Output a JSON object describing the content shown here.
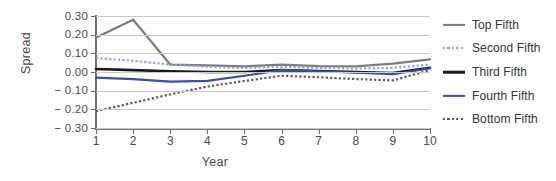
{
  "chart_data": {
    "type": "line",
    "title": "",
    "xlabel": "Year",
    "ylabel": "Spread",
    "x": [
      1,
      2,
      3,
      4,
      5,
      6,
      7,
      8,
      9,
      10
    ],
    "xtick_labels": [
      "1",
      "2",
      "3",
      "4",
      "5",
      "6",
      "7",
      "8",
      "9",
      "10"
    ],
    "ytick_labels": [
      "0.30",
      "0.20",
      "0.10",
      "0.00",
      "− 0.10",
      "− 0.20",
      "− 0.30"
    ],
    "ytick_values": [
      0.3,
      0.2,
      0.1,
      0.0,
      -0.1,
      -0.2,
      -0.3
    ],
    "ylim": [
      -0.3,
      0.3
    ],
    "xlim": [
      1,
      10
    ],
    "grid": "horizontal",
    "legend_position": "right",
    "series": [
      {
        "name": "Top Fifth",
        "style": "solid",
        "color": "#7c7c7c",
        "width": 2.2,
        "values": [
          0.185,
          0.28,
          0.04,
          0.035,
          0.03,
          0.04,
          0.032,
          0.03,
          0.045,
          0.068
        ]
      },
      {
        "name": "Second Fifth",
        "style": "dotted",
        "color": "#8fa7d4",
        "width": 2.2,
        "values": [
          0.075,
          0.06,
          0.04,
          0.028,
          0.022,
          0.028,
          0.022,
          0.018,
          0.022,
          0.04
        ]
      },
      {
        "name": "Third Fifth",
        "style": "solid",
        "color": "#1a1a1a",
        "width": 2.6,
        "values": [
          0.016,
          0.01,
          0.004,
          0.0,
          0.0,
          0.01,
          0.005,
          0.0,
          -0.005,
          0.022
        ]
      },
      {
        "name": "Fourth Fifth",
        "style": "solid",
        "color": "#3a4fa0",
        "width": 2.2,
        "values": [
          -0.03,
          -0.038,
          -0.052,
          -0.048,
          -0.02,
          0.01,
          0.004,
          -0.004,
          -0.012,
          0.02
        ]
      },
      {
        "name": "Bottom Fifth",
        "style": "dotted",
        "color": "#5a5a66",
        "width": 2.2,
        "values": [
          -0.21,
          -0.165,
          -0.12,
          -0.078,
          -0.048,
          -0.02,
          -0.028,
          -0.038,
          -0.045,
          0.01
        ]
      }
    ]
  }
}
